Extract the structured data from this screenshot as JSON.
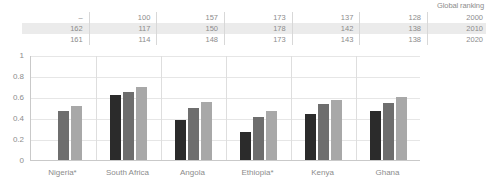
{
  "table": {
    "header_label": "Global ranking",
    "row_labels": [
      "2000",
      "2010",
      "2020"
    ],
    "rows": [
      [
        "–",
        "100",
        "157",
        "173",
        "137",
        "128"
      ],
      [
        "162",
        "117",
        "150",
        "178",
        "142",
        "138"
      ],
      [
        "161",
        "114",
        "148",
        "173",
        "143",
        "138"
      ]
    ]
  },
  "legend": {
    "items": [
      {
        "label": "2000",
        "color": "#2b2b2b"
      },
      {
        "label": "2010",
        "color": "#6e6e6e"
      },
      {
        "label": "2020",
        "color": "#a8a8a8"
      }
    ]
  },
  "chart_data": {
    "type": "bar",
    "title": "",
    "xlabel": "",
    "ylabel": "",
    "ylim": [
      0,
      1
    ],
    "yticks": [
      "0",
      "0.2",
      "0.4",
      "0.6",
      "0.8",
      "1"
    ],
    "grid": true,
    "legend_position": "right",
    "categories": [
      "Nigeria*",
      "South Africa",
      "Angola",
      "Ethiopia*",
      "Kenya",
      "Ghana"
    ],
    "series": [
      {
        "name": "2000",
        "color": "#2b2b2b",
        "values": [
          null,
          0.62,
          0.38,
          0.27,
          0.44,
          0.47
        ]
      },
      {
        "name": "2010",
        "color": "#6e6e6e",
        "values": [
          0.47,
          0.65,
          0.5,
          0.41,
          0.53,
          0.54
        ]
      },
      {
        "name": "2020",
        "color": "#a8a8a8",
        "values": [
          0.51,
          0.7,
          0.55,
          0.47,
          0.57,
          0.6
        ]
      }
    ],
    "global_ranking": {
      "header": "Global ranking",
      "years": [
        "2000",
        "2010",
        "2020"
      ],
      "values": {
        "Nigeria*": [
          "–",
          "162",
          "161"
        ],
        "South Africa": [
          "100",
          "117",
          "114"
        ],
        "Angola": [
          "157",
          "150",
          "148"
        ],
        "Ethiopia*": [
          "173",
          "178",
          "173"
        ],
        "Kenya": [
          "137",
          "142",
          "143"
        ],
        "Ghana": [
          "128",
          "138",
          "138"
        ]
      }
    }
  }
}
